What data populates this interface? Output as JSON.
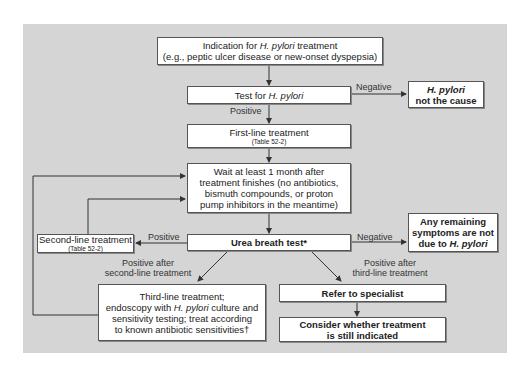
{
  "diagram": {
    "nodes": {
      "indication": {
        "line1_pre": "Indication for ",
        "line1_ital": "H. pylori",
        "line1_post": " treatment",
        "line2": "(e.g., peptic ulcer disease or new-onset dyspepsia)"
      },
      "test": {
        "pre": "Test for ",
        "ital": "H. pylori"
      },
      "not_cause": {
        "line1": "H. pylori",
        "line2": "not the cause"
      },
      "first_line": {
        "title": "First-line treatment",
        "ref": "(Table 52-2)"
      },
      "wait": {
        "line1": "Wait at least 1 month after",
        "line2": "treatment finishes (no antibiotics,",
        "line3": "bismuth compounds, or proton",
        "line4": "pump inhibitors in the meantime)"
      },
      "urea": {
        "label": "Urea breath test*"
      },
      "second_line": {
        "title": "Second-line treatment",
        "ref": "(Table 52-2)"
      },
      "remaining": {
        "line1": "Any remaining",
        "line2": "symptoms are not",
        "line3_pre": "due to ",
        "line3_ital": "H. pylori"
      },
      "third_line": {
        "line1": "Third-line treatment;",
        "line2_pre": "endoscopy with ",
        "line2_ital": "H. pylori",
        "line2_post": " culture and",
        "line3": "sensitivity testing; treat according",
        "line4": "to known antibiotic sensitivities†"
      },
      "refer": {
        "label": "Refer to specialist"
      },
      "consider": {
        "line1": "Consider whether treatment",
        "line2": "is still indicated"
      }
    },
    "edge_labels": {
      "negative_test": "Negative",
      "positive_test": "Positive",
      "positive_urea": "Positive",
      "negative_urea": "Negative",
      "after_second_1": "Positive after",
      "after_second_2": "second-line treatment",
      "after_third_1": "Positive after",
      "after_third_2": "third-line treatment"
    }
  }
}
